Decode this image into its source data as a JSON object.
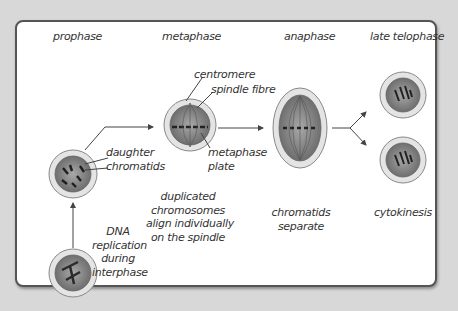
{
  "stages": {
    "prophase": "prophase",
    "metaphase": "metaphase",
    "anaphase": "anaphase",
    "late_telophase": "late telophase"
  },
  "annotations": {
    "daughter_chromatids": [
      "daughter",
      "chromatids"
    ],
    "centromere": "centromere",
    "spindle_fibre": "spindle fibre",
    "metaphase_plate": [
      "metaphase",
      "plate"
    ]
  },
  "descriptions": {
    "interphase": [
      "DNA",
      "replication",
      "during",
      "interphase"
    ],
    "metaphase": [
      "duplicated",
      "chromosomes",
      "align individually",
      "on the spindle"
    ],
    "anaphase": [
      "chromatids",
      "separate"
    ],
    "telophase": [
      "cytokinesis"
    ]
  },
  "colors": {
    "background": "#d8d8d8",
    "frame_border": "#555555",
    "cell_outer": "#e6e6e6",
    "cell_inner": "#8c8c8c",
    "text": "#333333"
  }
}
